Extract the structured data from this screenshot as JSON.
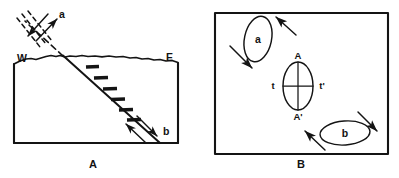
{
  "figure": {
    "title": "",
    "background_color": "#ffffff",
    "ink_color": "#141414",
    "panels": [
      {
        "id": "A",
        "caption": "A",
        "type": "cross-section",
        "labels": {
          "west": "W",
          "east": "E",
          "couple_a": "a",
          "slip_b": "b"
        }
      },
      {
        "id": "B",
        "caption": "B",
        "type": "map-view",
        "labels": {
          "ellipse_a": "a",
          "ellipse_b": "b",
          "axis_top": "A",
          "axis_bottom": "A'",
          "axis_left": "t",
          "axis_right": "t'"
        }
      }
    ]
  },
  "panel_a": {
    "caption": "A",
    "west_label": "W",
    "east_label": "E",
    "couple_label": "a",
    "slip_label": "b",
    "frame": {
      "x": 14,
      "y": 60,
      "width": 164,
      "height": 83
    },
    "hatch_marks": 6,
    "dashed_lines": 3,
    "couple_arrows": 2,
    "slip_arrows": 2
  },
  "panel_b": {
    "caption": "B",
    "ellipse_a_label": "a",
    "ellipse_b_label": "b",
    "strain_axis_top": "A",
    "strain_axis_bottom": "A'",
    "strain_axis_left": "t",
    "strain_axis_right": "t'",
    "frame": {
      "x": 215,
      "y": 13,
      "width": 173,
      "height": 141
    },
    "arrows": 4,
    "arrow_directions": [
      "down-right",
      "up-left",
      "up-left",
      "down-right"
    ]
  }
}
